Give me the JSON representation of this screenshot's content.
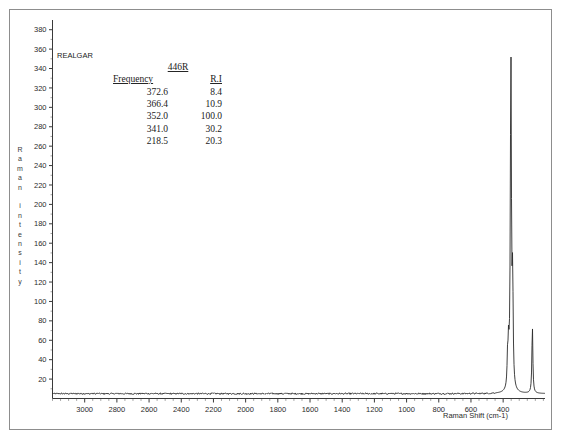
{
  "figure": {
    "sample_label": "REALGAR",
    "y_axis_title": "Raman intensity",
    "x_axis_title": "Raman Shift (cm-1)"
  },
  "table": {
    "title": "446R",
    "columns": [
      "Frequency",
      "R.I"
    ],
    "rows": [
      {
        "frequency": "372.6",
        "ri": "8.4"
      },
      {
        "frequency": "366.4",
        "ri": "10.9"
      },
      {
        "frequency": "352.0",
        "ri": "100.0"
      },
      {
        "frequency": "341.0",
        "ri": "30.2"
      },
      {
        "frequency": "218.5",
        "ri": "20.3"
      }
    ]
  },
  "chart_data": {
    "type": "line",
    "title": "REALGAR",
    "xlabel": "Raman Shift (cm-1)",
    "ylabel": "Raman intensity",
    "xlim": [
      3200,
      140
    ],
    "ylim": [
      0,
      390
    ],
    "x_reversed": true,
    "grid": false,
    "legend": "none",
    "xticks": [
      3000,
      2800,
      2600,
      2400,
      2200,
      2000,
      1800,
      1600,
      1400,
      1200,
      1000,
      800,
      600,
      400
    ],
    "xminor_step": 50,
    "yticks": [
      20,
      40,
      60,
      80,
      100,
      120,
      140,
      160,
      180,
      200,
      220,
      240,
      260,
      280,
      300,
      320,
      340,
      360,
      380
    ],
    "baseline_intensity": 5,
    "peaks": [
      {
        "shift": 372.6,
        "relative_intensity": 8.4,
        "intensity": 29,
        "width": 3.5
      },
      {
        "shift": 366.4,
        "relative_intensity": 10.9,
        "intensity": 38,
        "width": 3.5
      },
      {
        "shift": 352.0,
        "relative_intensity": 100.0,
        "intensity": 345,
        "width": 4.0
      },
      {
        "shift": 341.0,
        "relative_intensity": 30.2,
        "intensity": 104,
        "width": 3.5
      },
      {
        "shift": 218.5,
        "relative_intensity": 20.3,
        "intensity": 70,
        "width": 3.5
      }
    ]
  }
}
